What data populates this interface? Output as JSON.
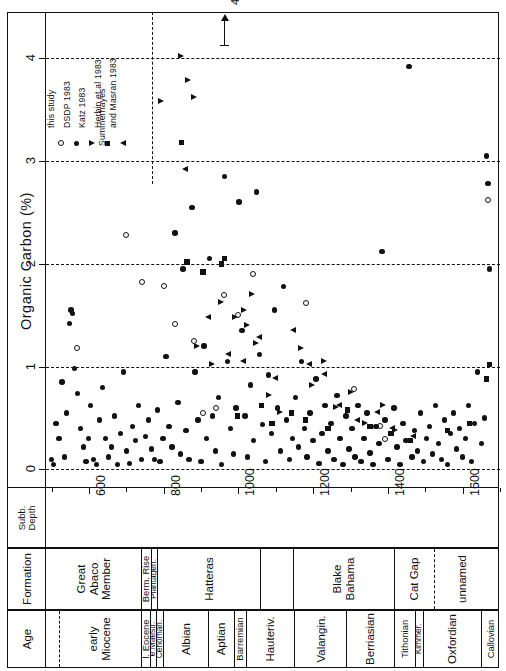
{
  "axes": {
    "y_title": "Organic  Carbon  (%)",
    "y_ticks": [
      "0",
      "1",
      "2",
      "3",
      "4"
    ],
    "x_ticks": [
      "600",
      "800",
      "1000",
      "1200",
      "1400",
      "1600"
    ],
    "depth_header": "Subb.\nDepth",
    "formation_header": "Formation",
    "age_header": "Age"
  },
  "annotation": {
    "value": "4.6"
  },
  "legend": [
    {
      "label": "this study",
      "symbol": "open-circle"
    },
    {
      "label": "DSDP 1983",
      "symbol": "filled-circle"
    },
    {
      "label": "Katz 1983",
      "symbol": "triangle-right"
    },
    {
      "label": "Herbin et al  1983",
      "symbol": "filled-square"
    },
    {
      "label": "Summerhayes\nand  Masran  1983",
      "symbol": "triangle-left"
    }
  ],
  "formations": [
    {
      "label": "Great\nAbaco\nMember",
      "x0": 485,
      "x1": 742,
      "size": "md"
    },
    {
      "label": "Berm. Rise",
      "x0": 742,
      "x1": 768,
      "size": "sm"
    },
    {
      "label": "Plantagen.",
      "x0": 768,
      "x1": 784,
      "size": "xs"
    },
    {
      "label": "Hatteras",
      "x0": 784,
      "x1": 1060,
      "size": "md"
    },
    {
      "label": "",
      "x0": 1060,
      "x1": 1148,
      "size": "md"
    },
    {
      "label": "Blake\nBahama",
      "x0": 1148,
      "x1": 1418,
      "size": "md"
    },
    {
      "label": "Cat Gap",
      "x0": 1418,
      "x1": 1527,
      "size": "md",
      "divider": "dash"
    },
    {
      "label": "unnamed",
      "x0": 1527,
      "x1": 1668,
      "size": "md"
    }
  ],
  "ages": [
    {
      "label": "",
      "x0": 485,
      "x1": 522,
      "divider": "dash"
    },
    {
      "label": "early\nMiocene",
      "x0": 522,
      "x1": 742,
      "size": "md"
    },
    {
      "label": "l. Eocene",
      "x0": 742,
      "x1": 766,
      "size": "sm"
    },
    {
      "label": "e Maestr.",
      "x0": 766,
      "x1": 782,
      "size": "xs"
    },
    {
      "label": "Cenoman.",
      "x0": 782,
      "x1": 800,
      "size": "xs"
    },
    {
      "label": "Albian",
      "x0": 800,
      "x1": 920,
      "size": "md"
    },
    {
      "label": "Aptian",
      "x0": 920,
      "x1": 990,
      "size": "md"
    },
    {
      "label": "Barremian",
      "x0": 990,
      "x1": 1022,
      "size": "sm"
    },
    {
      "label": "Hauteriv.",
      "x0": 1022,
      "x1": 1152,
      "size": "md"
    },
    {
      "label": "Valangin.",
      "x0": 1152,
      "x1": 1290,
      "size": "md"
    },
    {
      "label": "Berriasian",
      "x0": 1290,
      "x1": 1418,
      "size": "md"
    },
    {
      "label": "Tithonian",
      "x0": 1418,
      "x1": 1474,
      "size": "sm"
    },
    {
      "label": "Kimmer.",
      "x0": 1474,
      "x1": 1497,
      "size": "xs"
    },
    {
      "label": "Oxfordian",
      "x0": 1497,
      "x1": 1651,
      "size": "md"
    },
    {
      "label": "Callovian",
      "x0": 1651,
      "x1": 1700,
      "size": "sm"
    }
  ],
  "chart_data": {
    "type": "scatter",
    "title": "",
    "xlabel": "Subbottom Depth (m)",
    "ylabel": "Organic Carbon (%)",
    "xlim": [
      485,
      1700
    ],
    "ylim": [
      -0.18,
      4.45
    ],
    "grid": "horizontal-dashed at 0,1,2,3,4",
    "legend_position": "upper-left-inside",
    "vertical_divider_x": 770,
    "series": [
      {
        "name": "this study",
        "symbol": "open-circle",
        "points": [
          [
            568,
            1.18
          ],
          [
            700,
            2.28
          ],
          [
            742,
            1.82
          ],
          [
            800,
            1.78
          ],
          [
            830,
            1.42
          ],
          [
            880,
            1.25
          ],
          [
            905,
            0.55
          ],
          [
            940,
            0.6
          ],
          [
            962,
            1.7
          ],
          [
            1000,
            1.5
          ],
          [
            1040,
            1.9
          ],
          [
            1182,
            1.62
          ],
          [
            1310,
            0.78
          ],
          [
            1380,
            0.42
          ],
          [
            1392,
            0.3
          ],
          [
            1668,
            2.62
          ]
        ]
      },
      {
        "name": "DSDP 1983",
        "symbol": "filled-circle",
        "points": [
          [
            500,
            0.1
          ],
          [
            505,
            0.05
          ],
          [
            512,
            0.45
          ],
          [
            520,
            0.3
          ],
          [
            528,
            0.85
          ],
          [
            534,
            0.12
          ],
          [
            540,
            0.55
          ],
          [
            548,
            1.42
          ],
          [
            552,
            1.55
          ],
          [
            556,
            1.52
          ],
          [
            562,
            0.98
          ],
          [
            570,
            0.74
          ],
          [
            578,
            0.4
          ],
          [
            585,
            0.22
          ],
          [
            592,
            0.08
          ],
          [
            598,
            0.3
          ],
          [
            604,
            0.62
          ],
          [
            612,
            0.1
          ],
          [
            620,
            0.05
          ],
          [
            628,
            0.48
          ],
          [
            636,
            0.8
          ],
          [
            644,
            0.3
          ],
          [
            652,
            0.12
          ],
          [
            660,
            0.22
          ],
          [
            668,
            0.52
          ],
          [
            676,
            0.05
          ],
          [
            684,
            0.35
          ],
          [
            692,
            0.95
          ],
          [
            700,
            0.18
          ],
          [
            708,
            0.06
          ],
          [
            716,
            0.42
          ],
          [
            724,
            0.28
          ],
          [
            732,
            0.62
          ],
          [
            740,
            0.1
          ],
          [
            752,
            0.32
          ],
          [
            760,
            0.48
          ],
          [
            768,
            0.2
          ],
          [
            776,
            0.1
          ],
          [
            784,
            0.58
          ],
          [
            790,
            0.08
          ],
          [
            798,
            0.3
          ],
          [
            806,
            1.1
          ],
          [
            814,
            0.42
          ],
          [
            822,
            0.22
          ],
          [
            830,
            2.3
          ],
          [
            838,
            0.65
          ],
          [
            845,
            0.15
          ],
          [
            852,
            1.95
          ],
          [
            860,
            0.38
          ],
          [
            868,
            0.1
          ],
          [
            876,
            2.55
          ],
          [
            884,
            0.95
          ],
          [
            892,
            0.48
          ],
          [
            900,
            0.08
          ],
          [
            908,
            1.2
          ],
          [
            915,
            0.3
          ],
          [
            922,
            2.05
          ],
          [
            930,
            0.52
          ],
          [
            938,
            0.18
          ],
          [
            946,
            0.7
          ],
          [
            954,
            0.05
          ],
          [
            962,
            2.85
          ],
          [
            970,
            1.05
          ],
          [
            978,
            0.4
          ],
          [
            986,
            0.15
          ],
          [
            994,
            0.6
          ],
          [
            1002,
            2.6
          ],
          [
            1010,
            1.35
          ],
          [
            1018,
            0.52
          ],
          [
            1025,
            0.12
          ],
          [
            1032,
            0.82
          ],
          [
            1040,
            0.28
          ],
          [
            1048,
            2.7
          ],
          [
            1056,
            1.12
          ],
          [
            1064,
            0.44
          ],
          [
            1072,
            0.08
          ],
          [
            1080,
            0.92
          ],
          [
            1088,
            0.35
          ],
          [
            1096,
            1.55
          ],
          [
            1104,
            0.6
          ],
          [
            1112,
            0.18
          ],
          [
            1120,
            1.78
          ],
          [
            1128,
            0.48
          ],
          [
            1136,
            0.1
          ],
          [
            1144,
            0.3
          ],
          [
            1152,
            0.7
          ],
          [
            1160,
            0.22
          ],
          [
            1168,
            1.05
          ],
          [
            1176,
            0.4
          ],
          [
            1184,
            0.12
          ],
          [
            1192,
            0.55
          ],
          [
            1200,
            0.28
          ],
          [
            1208,
            0.88
          ],
          [
            1216,
            0.06
          ],
          [
            1224,
            0.35
          ],
          [
            1232,
            0.62
          ],
          [
            1240,
            0.18
          ],
          [
            1248,
            0.45
          ],
          [
            1256,
            0.1
          ],
          [
            1264,
            0.72
          ],
          [
            1272,
            0.3
          ],
          [
            1280,
            0.05
          ],
          [
            1288,
            0.52
          ],
          [
            1296,
            0.2
          ],
          [
            1304,
            0.4
          ],
          [
            1312,
            0.12
          ],
          [
            1320,
            0.62
          ],
          [
            1328,
            0.08
          ],
          [
            1336,
            0.3
          ],
          [
            1344,
            0.55
          ],
          [
            1352,
            0.16
          ],
          [
            1360,
            0.05
          ],
          [
            1368,
            0.42
          ],
          [
            1376,
            0.25
          ],
          [
            1384,
            2.12
          ],
          [
            1392,
            0.48
          ],
          [
            1400,
            0.1
          ],
          [
            1408,
            0.35
          ],
          [
            1416,
            0.6
          ],
          [
            1424,
            0.22
          ],
          [
            1432,
            0.05
          ],
          [
            1440,
            0.45
          ],
          [
            1448,
            0.28
          ],
          [
            1456,
            3.92
          ],
          [
            1464,
            0.12
          ],
          [
            1472,
            0.38
          ],
          [
            1480,
            0.18
          ],
          [
            1488,
            0.55
          ],
          [
            1496,
            0.08
          ],
          [
            1504,
            0.3
          ],
          [
            1512,
            0.42
          ],
          [
            1520,
            0.15
          ],
          [
            1528,
            0.62
          ],
          [
            1536,
            0.25
          ],
          [
            1544,
            0.1
          ],
          [
            1552,
            0.48
          ],
          [
            1560,
            0.05
          ],
          [
            1568,
            0.35
          ],
          [
            1576,
            0.55
          ],
          [
            1584,
            0.2
          ],
          [
            1592,
            0.4
          ],
          [
            1600,
            0.12
          ],
          [
            1608,
            0.3
          ],
          [
            1616,
            0.62
          ],
          [
            1624,
            0.08
          ],
          [
            1632,
            0.45
          ],
          [
            1640,
            0.95
          ],
          [
            1650,
            0.25
          ],
          [
            1658,
            0.5
          ],
          [
            1664,
            3.05
          ],
          [
            1668,
            2.78
          ],
          [
            1672,
            1.95
          ]
        ]
      },
      {
        "name": "Katz 1983",
        "symbol": "triangle-right",
        "points": [
          [
            793,
            3.58
          ],
          [
            846,
            4.02
          ],
          [
            865,
            3.78
          ],
          [
            882,
            3.62
          ],
          [
            888,
            1.2
          ],
          [
            930,
            1.02
          ],
          [
            952,
            1.62
          ],
          [
            990,
            1.48
          ],
          [
            1016,
            1.55
          ],
          [
            1024,
            1.4
          ],
          [
            1035,
            1.7
          ],
          [
            1048,
            1.22
          ],
          [
            1082,
            0.72
          ],
          [
            1110,
            0.55
          ],
          [
            1168,
            1.18
          ],
          [
            1196,
            0.82
          ],
          [
            1230,
            1.05
          ],
          [
            1262,
            0.6
          ],
          [
            1300,
            0.75
          ],
          [
            1340,
            0.45
          ],
          [
            1388,
            0.62
          ],
          [
            1420,
            0.38
          ]
        ]
      },
      {
        "name": "Herbin et al  1983",
        "symbol": "filled-square",
        "points": [
          [
            848,
            3.18
          ],
          [
            862,
            2.02
          ],
          [
            905,
            1.92
          ],
          [
            955,
            2.0
          ],
          [
            962,
            2.05
          ],
          [
            998,
            0.52
          ],
          [
            1062,
            0.62
          ],
          [
            1090,
            0.45
          ],
          [
            1142,
            0.55
          ],
          [
            1180,
            0.48
          ],
          [
            1240,
            0.4
          ],
          [
            1292,
            0.58
          ],
          [
            1352,
            0.42
          ],
          [
            1408,
            0.35
          ],
          [
            1460,
            0.28
          ],
          [
            1560,
            0.38
          ],
          [
            1618,
            0.45
          ],
          [
            1664,
            0.88
          ],
          [
            1672,
            1.02
          ]
        ]
      },
      {
        "name": "Summerhayes and Masran 1983",
        "symbol": "triangle-left",
        "points": [
          [
            858,
            2.92
          ],
          [
            918,
            1.48
          ],
          [
            972,
            1.12
          ],
          [
            1012,
            1.05
          ],
          [
            1055,
            1.28
          ],
          [
            1098,
            0.88
          ],
          [
            1145,
            1.35
          ],
          [
            1188,
            1.02
          ],
          [
            1228,
            0.92
          ],
          [
            1268,
            0.62
          ],
          [
            1318,
            0.48
          ],
          [
            1372,
            0.55
          ],
          [
            1412,
            0.4
          ],
          [
            1466,
            0.32
          ]
        ]
      }
    ]
  }
}
